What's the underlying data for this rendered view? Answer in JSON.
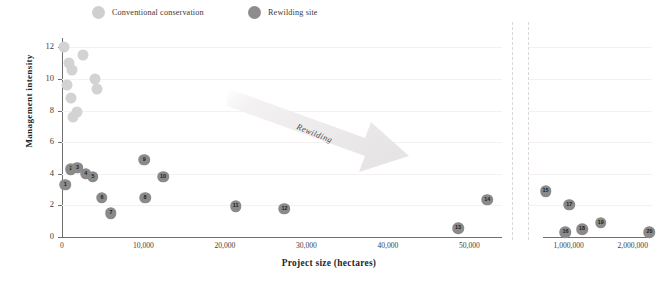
{
  "legend": {
    "items": [
      {
        "label": "Conventional conservation",
        "color": "#d3d3d3",
        "icon": "circle-marker-icon"
      },
      {
        "label": "Rewilding site",
        "color": "#8a8a8a",
        "icon": "circle-marker-icon"
      }
    ]
  },
  "annotation": {
    "label": "Rewilding",
    "icon": "arrow-right-down-icon",
    "color": "#eceaea"
  },
  "chart_data": {
    "type": "scatter",
    "title": "",
    "xlabel": "Project size (hectares)",
    "ylabel": "Management intensity",
    "grid": true,
    "legend_position": "top",
    "broken_axis": true,
    "axis_break_note": "x-axis broken between ~54,000 and ~600,000 hectares",
    "xlim_left": [
      0,
      54000
    ],
    "xlim_right": [
      600000,
      2300000
    ],
    "ylim": [
      0,
      12.6
    ],
    "yticks": [
      0,
      2,
      4,
      6,
      8,
      10,
      12
    ],
    "xticks_left": [
      0,
      10000,
      20000,
      30000,
      40000,
      50000
    ],
    "xticks_left_labels": [
      "0",
      "10,000",
      "20,000",
      "30,000",
      "40,000",
      "50,000"
    ],
    "xticks_right": [
      1000000,
      2000000
    ],
    "xticks_right_labels": [
      "1,000,000",
      "2,000,000"
    ],
    "series": [
      {
        "name": "Conventional conservation",
        "color": "#d3d3d3",
        "points": [
          {
            "x": 300,
            "y": 12.0,
            "label": ""
          },
          {
            "x": 2600,
            "y": 11.5,
            "label": ""
          },
          {
            "x": 900,
            "y": 11.0,
            "label": ""
          },
          {
            "x": 1200,
            "y": 10.6,
            "label": ""
          },
          {
            "x": 4100,
            "y": 10.0,
            "label": ""
          },
          {
            "x": 600,
            "y": 9.6,
            "label": ""
          },
          {
            "x": 4300,
            "y": 9.4,
            "label": ""
          },
          {
            "x": 1100,
            "y": 8.8,
            "label": ""
          },
          {
            "x": 1800,
            "y": 7.9,
            "label": ""
          },
          {
            "x": 1300,
            "y": 7.6,
            "label": ""
          }
        ]
      },
      {
        "name": "Rewilding site",
        "color": "#8a8a8a",
        "points": [
          {
            "x": 400,
            "y": 3.3,
            "label": "1"
          },
          {
            "x": 1100,
            "y": 4.3,
            "label": "2"
          },
          {
            "x": 1900,
            "y": 4.4,
            "label": "3"
          },
          {
            "x": 2900,
            "y": 4.0,
            "label": "4"
          },
          {
            "x": 3800,
            "y": 3.8,
            "label": "5"
          },
          {
            "x": 4900,
            "y": 2.5,
            "label": "6"
          },
          {
            "x": 6000,
            "y": 1.5,
            "label": "7"
          },
          {
            "x": 10200,
            "y": 2.5,
            "label": "8"
          },
          {
            "x": 10100,
            "y": 4.9,
            "label": "9"
          },
          {
            "x": 12400,
            "y": 3.8,
            "label": "10"
          },
          {
            "x": 21300,
            "y": 1.95,
            "label": "11"
          },
          {
            "x": 27300,
            "y": 1.8,
            "label": "12"
          },
          {
            "x": 48600,
            "y": 0.55,
            "label": "13"
          },
          {
            "x": 52200,
            "y": 2.35,
            "label": "14"
          },
          {
            "x": 640000,
            "y": 2.9,
            "label": "15"
          },
          {
            "x": 950000,
            "y": 0.3,
            "label": "16"
          },
          {
            "x": 1010000,
            "y": 2.05,
            "label": "17"
          },
          {
            "x": 1210000,
            "y": 0.5,
            "label": "18"
          },
          {
            "x": 1500000,
            "y": 0.9,
            "label": "19"
          },
          {
            "x": 2260000,
            "y": 0.3,
            "label": "20"
          }
        ]
      }
    ]
  }
}
